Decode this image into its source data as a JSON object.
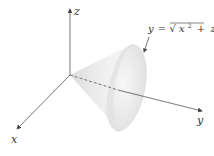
{
  "diagram": {
    "type": "3d-surface-plot",
    "surface": "cone",
    "axes": {
      "x": {
        "label": "x"
      },
      "y": {
        "label": "y"
      },
      "z": {
        "label": "z"
      }
    },
    "equation": {
      "lhs": "y",
      "equals": "=",
      "sqrt_symbol": "√",
      "radicand_x": "x",
      "radicand_x_exp": "2",
      "plus": "+",
      "radicand_z": "z",
      "radicand_z_exp": "2",
      "full_text": "y = √(x² + z²)"
    },
    "colors": {
      "axis": "#555555",
      "surface_light": "#f4f4f4",
      "surface_shade": "#d9d9d9",
      "base_fill": "#ececec",
      "text": "#333333"
    }
  }
}
